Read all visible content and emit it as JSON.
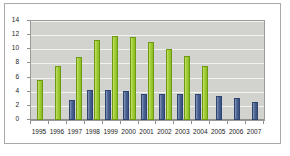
{
  "chart_data": {
    "type": "bar",
    "title": "",
    "xlabel": "",
    "ylabel": "",
    "ylim": [
      0,
      14
    ],
    "yticks": [
      0,
      2,
      4,
      6,
      8,
      10,
      12,
      14
    ],
    "grid": true,
    "legend": "none",
    "categories": [
      "1995",
      "1996",
      "1997",
      "1998",
      "1999",
      "2000",
      "2001",
      "2002",
      "2003",
      "2004",
      "2005",
      "2006",
      "2007"
    ],
    "series": [
      {
        "name": "blue-series",
        "color": "#48608f",
        "values": [
          null,
          null,
          2.8,
          4.2,
          4.2,
          4.1,
          3.7,
          3.7,
          3.7,
          3.7,
          3.4,
          3.1,
          2.6
        ]
      },
      {
        "name": "green-series",
        "color": "#9ecb30",
        "values": [
          5.6,
          7.6,
          8.9,
          11.3,
          11.9,
          11.7,
          11.0,
          10.1,
          9.1,
          7.7,
          null,
          null,
          null
        ]
      }
    ]
  },
  "colors": {
    "plot_background": "#d2d2ce",
    "gridline": "#f2f2f0",
    "axis": "#8e8e8a",
    "frame_border": "#a9a9a9",
    "green_bar": "#9ecb30",
    "blue_bar": "#48608f",
    "text": "#1a1a1a"
  }
}
